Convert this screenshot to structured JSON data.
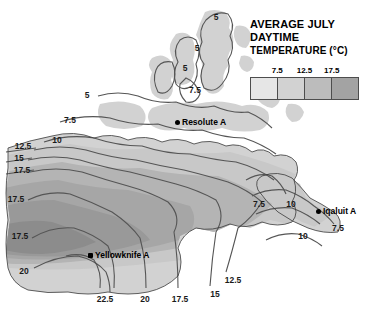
{
  "legend": {
    "title_line1": "AVERAGE JULY",
    "title_line2": "DAYTIME",
    "title_line3": "TEMPERATURE (°C)",
    "ticks": [
      {
        "label": "7.5",
        "x_pct": 25
      },
      {
        "label": "12.5",
        "x_pct": 50
      },
      {
        "label": "17.5",
        "x_pct": 75
      }
    ],
    "swatches": [
      {
        "color": "#e6e6e6"
      },
      {
        "color": "#d2d2d2"
      },
      {
        "color": "#bcbcbc"
      },
      {
        "color": "#a3a3a3"
      }
    ]
  },
  "chart_data": {
    "type": "map",
    "title": "AVERAGE JULY DAYTIME TEMPERATURE (°C)",
    "variable": "Average July daytime temperature",
    "units": "°C",
    "contour_interval": 2.5,
    "legend_breaks": [
      7.5,
      12.5,
      17.5
    ],
    "contour_labels": [
      {
        "value": "5",
        "x": 216,
        "y": 17
      },
      {
        "value": "5",
        "x": 197,
        "y": 48
      },
      {
        "value": "5",
        "x": 185,
        "y": 68
      },
      {
        "value": "7.5",
        "x": 195,
        "y": 90
      },
      {
        "value": "5",
        "x": 87,
        "y": 95
      },
      {
        "value": "7.5",
        "x": 70,
        "y": 120
      },
      {
        "value": "10",
        "x": 57,
        "y": 140
      },
      {
        "value": "12.5",
        "x": 23,
        "y": 146
      },
      {
        "value": "15",
        "x": 19,
        "y": 158
      },
      {
        "value": "17.5",
        "x": 22,
        "y": 170
      },
      {
        "value": "17.5",
        "x": 16,
        "y": 199
      },
      {
        "value": "17.5",
        "x": 20,
        "y": 236
      },
      {
        "value": "20",
        "x": 24,
        "y": 271
      },
      {
        "value": "22.5",
        "x": 105,
        "y": 299
      },
      {
        "value": "20",
        "x": 145,
        "y": 299
      },
      {
        "value": "17.5",
        "x": 180,
        "y": 299
      },
      {
        "value": "15",
        "x": 215,
        "y": 294
      },
      {
        "value": "12.5",
        "x": 233,
        "y": 280
      },
      {
        "value": "10",
        "x": 303,
        "y": 236
      },
      {
        "value": "7.5",
        "x": 338,
        "y": 228
      },
      {
        "value": "10",
        "x": 291,
        "y": 204
      },
      {
        "value": "7.5",
        "x": 259,
        "y": 204
      }
    ],
    "stations": [
      {
        "name": "Resolute A",
        "x": 175,
        "y": 122,
        "marker": "circle"
      },
      {
        "name": "Yellowknife A",
        "x": 88,
        "y": 255,
        "marker": "square"
      },
      {
        "name": "Iqaluit A",
        "x": 316,
        "y": 211,
        "marker": "circle"
      }
    ]
  }
}
